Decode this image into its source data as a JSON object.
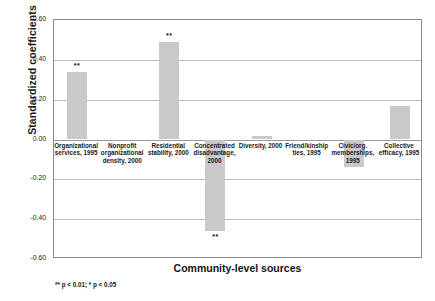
{
  "chart_data": {
    "type": "bar",
    "title": "",
    "xlabel": "Community-level sources",
    "ylabel": "Standardized coefficients",
    "ylim": [
      -0.6,
      0.6
    ],
    "ytick_labels": [
      "0.60",
      "0.40",
      "0.20",
      "0.00",
      "-0.20",
      "-0.40",
      "-0.60"
    ],
    "ytick_values": [
      0.6,
      0.4,
      0.2,
      0.0,
      -0.2,
      -0.4,
      -0.6
    ],
    "grid": true,
    "legend": "none",
    "bar_color": "#c9c9c9",
    "categories": [
      "Organizational services, 1995",
      "Nonprofit organizational density, 2000",
      "Residential stability, 2000",
      "Concentrated disadvantage, 2000",
      "Diversity, 2000",
      "Friend/kinship ties, 1995",
      "Civic/org. memberships, 1995",
      "Collective efficacy, 1995"
    ],
    "values": [
      0.34,
      0.0,
      0.49,
      -0.46,
      0.02,
      0.0,
      -0.14,
      0.17
    ],
    "significance": [
      "**",
      "",
      "**",
      "**",
      "",
      "",
      "",
      ""
    ],
    "annotations": [
      "** p < 0.01; * p < 0.05"
    ]
  },
  "footnote": "** p < 0.01; * p < 0.05",
  "category_lines": [
    [
      "Organizational",
      "services, 1995"
    ],
    [
      "Nonprofit",
      "organizational",
      "density, 2000"
    ],
    [
      "Residential",
      "stability, 2000"
    ],
    [
      "Concentrated",
      "disadvantage,",
      "2000"
    ],
    [
      "Diversity, 2000"
    ],
    [
      "Friend/kinship",
      "ties, 1995"
    ],
    [
      "Civic/org.",
      "memberships,",
      "1995"
    ],
    [
      "Collective",
      "efficacy, 1995"
    ]
  ]
}
